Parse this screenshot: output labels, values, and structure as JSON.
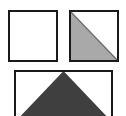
{
  "canvas": {
    "width": 126,
    "height": 116,
    "background_color": "#ffffff",
    "description": "Three bordered square tiles on a white background"
  },
  "style": {
    "border_color": "#1a1a1a",
    "border_width": 2,
    "fill_white": "#ffffff",
    "fill_light_gray": "#a9a9a9",
    "fill_dark_gray": "#3f3f3f"
  },
  "tiles": [
    {
      "id": "tile-empty",
      "label": "Empty square tile",
      "position": "top-left",
      "x": 8,
      "y": 10,
      "width": 50,
      "height": 52,
      "shape": "none",
      "fill": "#ffffff",
      "border_color": "#1a1a1a"
    },
    {
      "id": "tile-diagonal",
      "label": "Half-filled diagonal square tile",
      "position": "top-right",
      "x": 69,
      "y": 10,
      "width": 50,
      "height": 52,
      "shape": "lower-left-triangle",
      "fill": "#a9a9a9",
      "border_color": "#1a1a1a",
      "polygon_points": "0,0 0,52 50,52"
    },
    {
      "id": "tile-peak",
      "label": "Upward peak triangle tile",
      "position": "bottom-center",
      "x": 14,
      "y": 70,
      "width": 99,
      "height": 52,
      "shape": "upward-triangle",
      "fill": "#3f3f3f",
      "border_color": "#1a1a1a",
      "polygon_points": "49.5,0 99,52 0,52",
      "clipped": "bottom edge cropped by image boundary"
    }
  ]
}
